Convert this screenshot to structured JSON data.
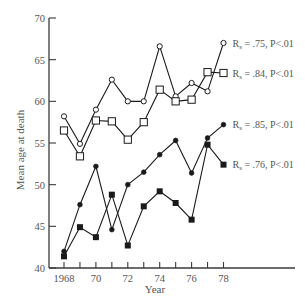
{
  "chart_data": {
    "type": "line",
    "title": "",
    "xlabel": "Year",
    "ylabel": "Mean age at death",
    "xlim": [
      1968,
      1978
    ],
    "ylim": [
      40,
      70
    ],
    "grid": false,
    "x": [
      1968,
      1969,
      1970,
      1971,
      1972,
      1973,
      1974,
      1975,
      1976,
      1977,
      1978
    ],
    "x_tick_labels": [
      {
        "value": 1968,
        "label": "1968"
      },
      {
        "value": 1970,
        "label": "70"
      },
      {
        "value": 1972,
        "label": "72"
      },
      {
        "value": 1974,
        "label": "74"
      },
      {
        "value": 1976,
        "label": "76"
      },
      {
        "value": 1978,
        "label": "78"
      }
    ],
    "x_minor_ticks": [
      1969,
      1971,
      1973,
      1975,
      1977
    ],
    "y_ticks": [
      40,
      45,
      50,
      55,
      60,
      65,
      70
    ],
    "series": [
      {
        "name": "open-circle",
        "marker": "open-circle",
        "values": [
          58.2,
          54.9,
          59.0,
          62.6,
          60.0,
          60.0,
          66.6,
          60.6,
          62.2,
          61.2,
          67.0
        ],
        "annotation": {
          "r_label": "R",
          "r_sub": "s",
          "text": " = .75, P<.01"
        }
      },
      {
        "name": "open-square",
        "marker": "open-square",
        "values": [
          56.5,
          53.4,
          57.7,
          57.6,
          55.4,
          57.5,
          61.4,
          60.0,
          60.2,
          63.5,
          63.4
        ],
        "annotation": {
          "r_label": "R",
          "r_sub": "s",
          "text": " = .84, P<.01"
        }
      },
      {
        "name": "filled-circle",
        "marker": "filled-circle",
        "values": [
          42.0,
          47.6,
          52.2,
          44.6,
          50.0,
          51.5,
          53.6,
          55.3,
          51.4,
          55.6,
          57.2
        ],
        "annotation": {
          "r_label": "R",
          "r_sub": "s",
          "text": " = .85, P<.01"
        }
      },
      {
        "name": "filled-square",
        "marker": "filled-square",
        "values": [
          41.4,
          44.9,
          43.7,
          48.8,
          42.7,
          47.4,
          49.2,
          47.8,
          45.8,
          54.8,
          52.4
        ],
        "annotation": {
          "r_label": "R",
          "r_sub": "s",
          "text": " = .76, P<.01"
        }
      }
    ]
  },
  "colors": {
    "ink": "#1a1a1a",
    "axis": "#3a3a3a",
    "text": "#555555",
    "background": "#ffffff"
  }
}
